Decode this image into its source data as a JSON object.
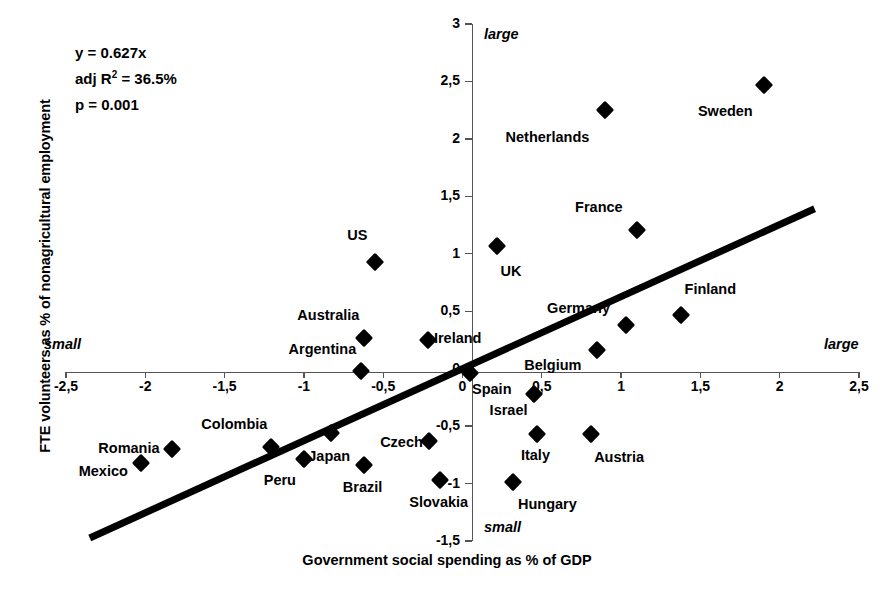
{
  "chart_data": {
    "type": "scatter",
    "title": "",
    "xlabel": "Government social spending as % of GDP",
    "ylabel": "FTE volunteers as % of nonagricultural employment",
    "xlim": [
      -2.5,
      2.5
    ],
    "ylim": [
      -1.5,
      3
    ],
    "grid": false,
    "legend": "none",
    "xticks": [
      "-2,5",
      "-2",
      "-1,5",
      "-1",
      "-0,5",
      "0",
      "0,5",
      "1",
      "1,5",
      "2",
      "2,5"
    ],
    "xtick_values": [
      -2.5,
      -2,
      -1.5,
      -1,
      -0.5,
      0,
      0.5,
      1,
      1.5,
      2,
      2.5
    ],
    "yticks": [
      "3",
      "2,5",
      "2",
      "1,5",
      "1",
      "0,5",
      "0",
      "-0,5",
      "-1",
      "-1,5"
    ],
    "ytick_values": [
      3,
      2.5,
      2,
      1.5,
      1,
      0.5,
      0,
      -0.5,
      -1,
      -1.5
    ],
    "annotations": {
      "equation": "y = 0.627x",
      "r2_prefix": "adj R",
      "r2_sup": "2",
      "r2_value": " = 36.5%",
      "pvalue": "p = 0.001",
      "axis_hint_x_small": "small",
      "axis_hint_x_large": "large",
      "axis_hint_y_large": "large",
      "axis_hint_y_small": "small"
    },
    "trendline": {
      "slope": 0.627,
      "intercept": 0,
      "x_start": -2.35,
      "x_end": 2.22
    },
    "points": [
      {
        "label": "Sweden",
        "x": 1.9,
        "y": 2.47,
        "lx": -0.07,
        "ly": -0.23,
        "anchor": "right"
      },
      {
        "label": "Netherlands",
        "x": 0.9,
        "y": 2.25,
        "lx": -0.1,
        "ly": -0.23,
        "anchor": "right"
      },
      {
        "label": "France",
        "x": 1.1,
        "y": 1.21,
        "lx": -0.09,
        "ly": 0.2,
        "anchor": "right"
      },
      {
        "label": "UK",
        "x": 0.22,
        "y": 1.07,
        "lx": 0.02,
        "ly": -0.22,
        "anchor": "left"
      },
      {
        "label": "US",
        "x": -0.55,
        "y": 0.93,
        "lx": -0.05,
        "ly": 0.23,
        "anchor": "right"
      },
      {
        "label": "Finland",
        "x": 1.38,
        "y": 0.47,
        "lx": 0.02,
        "ly": 0.22,
        "anchor": "left"
      },
      {
        "label": "Germany",
        "x": 1.03,
        "y": 0.38,
        "lx": -0.1,
        "ly": 0.15,
        "anchor": "right"
      },
      {
        "label": "Australia",
        "x": -0.62,
        "y": 0.27,
        "lx": -0.03,
        "ly": 0.2,
        "anchor": "right"
      },
      {
        "label": "Ireland",
        "x": -0.22,
        "y": 0.25,
        "lx": 0.04,
        "ly": 0.02,
        "anchor": "left"
      },
      {
        "label": "Belgium",
        "x": 0.85,
        "y": 0.16,
        "lx": -0.1,
        "ly": -0.13,
        "anchor": "right"
      },
      {
        "label": "Argentina",
        "x": -0.64,
        "y": -0.02,
        "lx": -0.03,
        "ly": 0.19,
        "anchor": "right"
      },
      {
        "label": "Spain",
        "x": 0.05,
        "y": -0.04,
        "lx": 0.01,
        "ly": -0.14,
        "anchor": "left"
      },
      {
        "label": "Israel",
        "x": 0.45,
        "y": -0.22,
        "lx": -0.04,
        "ly": -0.14,
        "anchor": "right"
      },
      {
        "label": "Italy",
        "x": 0.47,
        "y": -0.57,
        "lx": -0.01,
        "ly": -0.18,
        "anchor": "center"
      },
      {
        "label": "Austria",
        "x": 0.81,
        "y": -0.57,
        "lx": 0.02,
        "ly": -0.2,
        "anchor": "left"
      },
      {
        "label": "Czech",
        "x": -0.21,
        "y": -0.63,
        "lx": -0.04,
        "ly": -0.01,
        "anchor": "right"
      },
      {
        "label": "Japan",
        "x": -0.83,
        "y": -0.56,
        "lx": -0.01,
        "ly": -0.2,
        "anchor": "center"
      },
      {
        "label": "Colombia",
        "x": -1.21,
        "y": -0.68,
        "lx": -0.02,
        "ly": 0.2,
        "anchor": "right"
      },
      {
        "label": "Romania",
        "x": -1.83,
        "y": -0.7,
        "lx": -0.08,
        "ly": 0.01,
        "anchor": "right"
      },
      {
        "label": "Peru",
        "x": -1.0,
        "y": -0.79,
        "lx": -0.05,
        "ly": -0.18,
        "anchor": "right"
      },
      {
        "label": "Mexico",
        "x": -2.03,
        "y": -0.82,
        "lx": -0.08,
        "ly": -0.07,
        "anchor": "right"
      },
      {
        "label": "Brazil",
        "x": -0.62,
        "y": -0.84,
        "lx": -0.01,
        "ly": -0.19,
        "anchor": "center"
      },
      {
        "label": "Slovakia",
        "x": -0.14,
        "y": -0.97,
        "lx": -0.01,
        "ly": -0.19,
        "anchor": "center"
      },
      {
        "label": "Hungary",
        "x": 0.32,
        "y": -0.99,
        "lx": 0.03,
        "ly": -0.19,
        "anchor": "left"
      }
    ]
  }
}
